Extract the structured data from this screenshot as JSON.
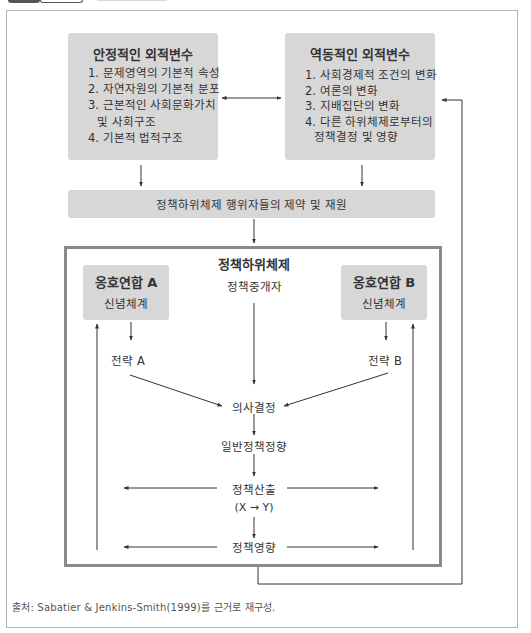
{
  "figure": {
    "caption": "출처: Sabatier & Jenkins-Smith(1999)를 근거로 재구성."
  },
  "stable_parameters": {
    "title": "안정적인 외적변수",
    "items": [
      "1. 문제영역의 기본적 속성",
      "2. 자연자원의 기본적 분포",
      "3. 근본적인 사회문화가치",
      "및 사회구조",
      "4. 기본적 법적구조"
    ]
  },
  "dynamic_events": {
    "title": "역동적인 외적변수",
    "items": [
      "1. 사회경제적 조건의 변화",
      "2. 여론의 변화",
      "3. 지배집단의 변화",
      "4. 다른 하위체제로부터의",
      "정책결정 및 영향"
    ]
  },
  "constraints_bar": {
    "label": "정책하위체제 행위자들의 제약 및 재원"
  },
  "subsystem": {
    "title": "정책하위체제",
    "broker": "정책중개자",
    "coalition_a": {
      "title": "옹호연합 A",
      "belief": "신념체계",
      "strategy": "전략 A"
    },
    "coalition_b": {
      "title": "옹호연합 B",
      "belief": "신념체계",
      "strategy": "전략 B"
    },
    "flow": {
      "decision": "의사결정",
      "general_orientation": "일반정책정향",
      "output": "정책산출",
      "output_formula": "(X → Y)",
      "impact": "정책영향"
    }
  },
  "colors": {
    "box_fill": "#d7d7d7",
    "subsystem_border": "#8a8a8a",
    "line": "#333333",
    "frame": "#b5b5b5"
  }
}
